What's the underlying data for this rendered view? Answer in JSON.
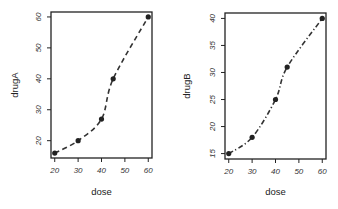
{
  "chart_data": [
    {
      "type": "line",
      "title": "",
      "xlabel": "dose",
      "ylabel": "drugA",
      "x": [
        20,
        30,
        40,
        45,
        60
      ],
      "series": [
        {
          "name": "drugA",
          "values": [
            16,
            20,
            27,
            40,
            60
          ],
          "line_style": "dashed",
          "marker": "filled-circle"
        }
      ],
      "xticks": [
        20,
        30,
        40,
        50,
        60
      ],
      "yticks": [
        20,
        30,
        40,
        50,
        60
      ],
      "xlim": [
        18.4,
        61.6
      ],
      "ylim": [
        14.4,
        61.6
      ],
      "grid": false,
      "legend": "none"
    },
    {
      "type": "line",
      "title": "",
      "xlabel": "dose",
      "ylabel": "drugB",
      "x": [
        20,
        30,
        40,
        45,
        60
      ],
      "series": [
        {
          "name": "drugB",
          "values": [
            15,
            18,
            25,
            31,
            40
          ],
          "line_style": "dash-dot",
          "marker": "filled-circle"
        }
      ],
      "xticks": [
        20,
        30,
        40,
        50,
        60
      ],
      "yticks": [
        15,
        20,
        25,
        30,
        35,
        40
      ],
      "xlim": [
        18.4,
        61.6
      ],
      "ylim": [
        14.0,
        41.0
      ],
      "grid": false,
      "legend": "none"
    }
  ],
  "panels": [
    {
      "xlabel": "dose",
      "ylabel": "drugA",
      "xticks": [
        "20",
        "30",
        "40",
        "50",
        "60"
      ],
      "yticks": [
        "20",
        "30",
        "40",
        "50",
        "60"
      ]
    },
    {
      "xlabel": "dose",
      "ylabel": "drugB",
      "xticks": [
        "20",
        "30",
        "40",
        "50",
        "60"
      ],
      "yticks": [
        "15",
        "20",
        "25",
        "30",
        "35",
        "40"
      ]
    }
  ],
  "colors": {
    "line": "#333333",
    "marker": "#222222",
    "axis": "#222222"
  }
}
